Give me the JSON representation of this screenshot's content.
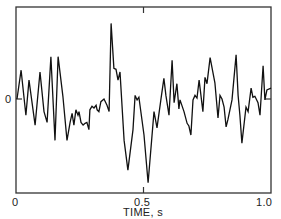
{
  "chart_data": {
    "type": "line",
    "title": "",
    "xlabel": "TIME, s",
    "ylabel": "",
    "xlim": [
      0,
      1.0
    ],
    "ylim_relative": [
      -1.05,
      1.0
    ],
    "grid": false,
    "legend": null,
    "x_ticks": [
      {
        "value": 0,
        "label": "0"
      },
      {
        "value": 0.5,
        "label": "0.5"
      },
      {
        "value": 1.0,
        "label": "1.0"
      }
    ],
    "y_ticks": [
      {
        "value": 0,
        "label": "0"
      }
    ],
    "annotations": [],
    "series": [
      {
        "name": "signal",
        "description": "Random-looking noise waveform vs time, amplitude in relative units (0 at center line, approx. +1 at top frame)",
        "x": [
          0.004,
          0.02,
          0.039,
          0.051,
          0.075,
          0.094,
          0.11,
          0.122,
          0.137,
          0.153,
          0.165,
          0.184,
          0.2,
          0.212,
          0.22,
          0.227,
          0.235,
          0.243,
          0.247,
          0.255,
          0.263,
          0.271,
          0.278,
          0.286,
          0.29,
          0.298,
          0.306,
          0.314,
          0.318,
          0.325,
          0.333,
          0.345,
          0.357,
          0.365,
          0.373,
          0.384,
          0.392,
          0.4,
          0.408,
          0.424,
          0.439,
          0.459,
          0.467,
          0.475,
          0.482,
          0.502,
          0.518,
          0.541,
          0.553,
          0.569,
          0.58,
          0.588,
          0.6,
          0.612,
          0.62,
          0.631,
          0.639,
          0.643,
          0.659,
          0.671,
          0.678,
          0.686,
          0.694,
          0.702,
          0.71,
          0.718,
          0.733,
          0.741,
          0.749,
          0.761,
          0.78,
          0.792,
          0.8,
          0.808,
          0.816,
          0.824,
          0.831,
          0.847,
          0.863,
          0.871,
          0.878,
          0.886,
          0.902,
          0.91,
          0.922,
          0.929,
          0.937,
          0.949,
          0.957,
          0.969,
          0.976,
          0.984,
          1.0
        ],
        "y": [
          0.0,
          0.32,
          -0.18,
          0.21,
          -0.29,
          0.3,
          -0.14,
          -0.26,
          0.47,
          -0.46,
          0.47,
          0.03,
          -0.46,
          -0.26,
          -0.16,
          -0.29,
          -0.12,
          -0.18,
          -0.14,
          -0.26,
          -0.29,
          -0.27,
          -0.26,
          -0.34,
          -0.12,
          -0.08,
          -0.1,
          -0.07,
          -0.12,
          -0.14,
          -0.03,
          0.0,
          -0.07,
          -0.14,
          0.84,
          0.34,
          0.33,
          0.21,
          0.3,
          -0.46,
          -0.79,
          -0.34,
          0.04,
          -0.01,
          0.02,
          -0.4,
          -0.93,
          -0.14,
          -0.32,
          0.01,
          0.23,
          0.04,
          -0.18,
          0.43,
          -0.04,
          0.17,
          -0.11,
          -0.01,
          -0.14,
          -0.27,
          -0.3,
          -0.4,
          -0.01,
          0.04,
          0.01,
          0.21,
          -0.14,
          0.24,
          0.17,
          0.46,
          0.18,
          -0.21,
          0.04,
          0.0,
          -0.09,
          -0.31,
          -0.23,
          -0.01,
          0.49,
          0.04,
          -0.18,
          -0.49,
          -0.09,
          -0.14,
          0.12,
          0.02,
          0.03,
          -0.04,
          -0.18,
          0.37,
          -0.01,
          0.1,
          0.12
        ]
      }
    ]
  },
  "plot": {
    "frame": {
      "left": 16,
      "right": 271,
      "top": 7,
      "bottom": 193
    },
    "zero_y_px": 99,
    "px_per_unit": 90,
    "line_color": "#111111",
    "frame_color": "#333333"
  },
  "labels": {
    "y_zero": "0",
    "x_start": "0",
    "x_mid": "0.5",
    "x_end": "1.0",
    "x_axis_title": "TIME, s"
  }
}
